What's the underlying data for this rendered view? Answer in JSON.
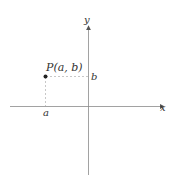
{
  "diagram": {
    "axes": {
      "x_label": "x",
      "y_label": "y"
    },
    "point": {
      "label": "P(a, b)",
      "x_coord_label": "a",
      "y_coord_label": "b"
    },
    "colors": {
      "axis": "#8a8a8a",
      "guide": "#b0b0b0",
      "point": "#222222",
      "text": "#333333"
    }
  }
}
